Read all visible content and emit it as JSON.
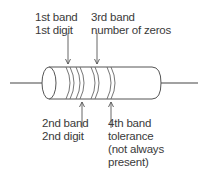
{
  "diagram": {
    "labels": {
      "band1": {
        "line1": "1st band",
        "line2": "1st digit"
      },
      "band3": {
        "line1": "3rd band",
        "line2": "number of zeros"
      },
      "band2": {
        "line1": "2nd band",
        "line2": "2nd digit"
      },
      "band4": {
        "line1": "4th band",
        "line2": "tolerance",
        "line3": "(not always",
        "line4": "present)"
      }
    },
    "colors": {
      "stroke": "#555555",
      "text": "#3a3a3a",
      "background": "#ffffff"
    }
  }
}
